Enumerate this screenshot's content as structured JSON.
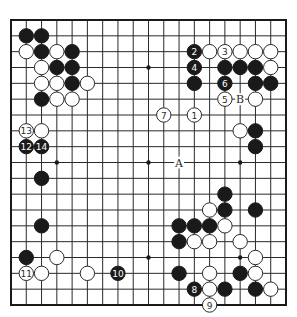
{
  "diagram": {
    "type": "go-board",
    "size": 19,
    "colors": {
      "black": "#1a1a1a",
      "white": "#ffffff",
      "line": "#2a2a2a",
      "background": "#ffffff"
    },
    "star_points": [
      [
        3,
        3
      ],
      [
        9,
        3
      ],
      [
        15,
        3
      ],
      [
        3,
        9
      ],
      [
        9,
        9
      ],
      [
        15,
        9
      ],
      [
        3,
        15
      ],
      [
        9,
        15
      ],
      [
        15,
        15
      ]
    ],
    "stones": [
      {
        "c": 1,
        "r": 1,
        "color": "black"
      },
      {
        "c": 2,
        "r": 1,
        "color": "black"
      },
      {
        "c": 1,
        "r": 2,
        "color": "white"
      },
      {
        "c": 2,
        "r": 2,
        "color": "black"
      },
      {
        "c": 3,
        "r": 2,
        "color": "white"
      },
      {
        "c": 4,
        "r": 2,
        "color": "black"
      },
      {
        "c": 2,
        "r": 3,
        "color": "white"
      },
      {
        "c": 3,
        "r": 3,
        "color": "black"
      },
      {
        "c": 4,
        "r": 3,
        "color": "black"
      },
      {
        "c": 2,
        "r": 4,
        "color": "white"
      },
      {
        "c": 3,
        "r": 4,
        "color": "white"
      },
      {
        "c": 4,
        "r": 4,
        "color": "black"
      },
      {
        "c": 5,
        "r": 4,
        "color": "white"
      },
      {
        "c": 2,
        "r": 5,
        "color": "black"
      },
      {
        "c": 3,
        "r": 5,
        "color": "white"
      },
      {
        "c": 4,
        "r": 5,
        "color": "white"
      },
      {
        "c": 1,
        "r": 7,
        "color": "white",
        "number": "13"
      },
      {
        "c": 2,
        "r": 7,
        "color": "white"
      },
      {
        "c": 1,
        "r": 8,
        "color": "black",
        "number": "12"
      },
      {
        "c": 2,
        "r": 8,
        "color": "black",
        "number": "14"
      },
      {
        "c": 2,
        "r": 10,
        "color": "black"
      },
      {
        "c": 2,
        "r": 13,
        "color": "black"
      },
      {
        "c": 1,
        "r": 15,
        "color": "black"
      },
      {
        "c": 3,
        "r": 15,
        "color": "white"
      },
      {
        "c": 1,
        "r": 16,
        "color": "white",
        "number": "11"
      },
      {
        "c": 2,
        "r": 16,
        "color": "white"
      },
      {
        "c": 5,
        "r": 16,
        "color": "white"
      },
      {
        "c": 7,
        "r": 16,
        "color": "black",
        "number": "10"
      },
      {
        "c": 12,
        "r": 2,
        "color": "black",
        "number": "2"
      },
      {
        "c": 13,
        "r": 2,
        "color": "white"
      },
      {
        "c": 14,
        "r": 2,
        "color": "white",
        "number": "3"
      },
      {
        "c": 15,
        "r": 2,
        "color": "white"
      },
      {
        "c": 16,
        "r": 2,
        "color": "white"
      },
      {
        "c": 17,
        "r": 2,
        "color": "white"
      },
      {
        "c": 12,
        "r": 3,
        "color": "black",
        "number": "4"
      },
      {
        "c": 14,
        "r": 3,
        "color": "black"
      },
      {
        "c": 15,
        "r": 3,
        "color": "black"
      },
      {
        "c": 16,
        "r": 3,
        "color": "black"
      },
      {
        "c": 17,
        "r": 3,
        "color": "white"
      },
      {
        "c": 12,
        "r": 4,
        "color": "black"
      },
      {
        "c": 14,
        "r": 4,
        "color": "black",
        "number": "6"
      },
      {
        "c": 16,
        "r": 4,
        "color": "black"
      },
      {
        "c": 17,
        "r": 4,
        "color": "black"
      },
      {
        "c": 14,
        "r": 5,
        "color": "white",
        "number": "5"
      },
      {
        "c": 16,
        "r": 5,
        "color": "white"
      },
      {
        "c": 10,
        "r": 6,
        "color": "white",
        "number": "7"
      },
      {
        "c": 12,
        "r": 6,
        "color": "white",
        "number": "1"
      },
      {
        "c": 15,
        "r": 7,
        "color": "white"
      },
      {
        "c": 16,
        "r": 7,
        "color": "black"
      },
      {
        "c": 16,
        "r": 8,
        "color": "black"
      },
      {
        "c": 14,
        "r": 11,
        "color": "black"
      },
      {
        "c": 13,
        "r": 12,
        "color": "white"
      },
      {
        "c": 14,
        "r": 12,
        "color": "black"
      },
      {
        "c": 16,
        "r": 12,
        "color": "black"
      },
      {
        "c": 11,
        "r": 13,
        "color": "black"
      },
      {
        "c": 12,
        "r": 13,
        "color": "black"
      },
      {
        "c": 13,
        "r": 13,
        "color": "black"
      },
      {
        "c": 14,
        "r": 13,
        "color": "white"
      },
      {
        "c": 11,
        "r": 14,
        "color": "black"
      },
      {
        "c": 12,
        "r": 14,
        "color": "white"
      },
      {
        "c": 13,
        "r": 14,
        "color": "white"
      },
      {
        "c": 15,
        "r": 14,
        "color": "white"
      },
      {
        "c": 16,
        "r": 15,
        "color": "white"
      },
      {
        "c": 11,
        "r": 16,
        "color": "black"
      },
      {
        "c": 13,
        "r": 16,
        "color": "white"
      },
      {
        "c": 15,
        "r": 16,
        "color": "black"
      },
      {
        "c": 16,
        "r": 16,
        "color": "white"
      },
      {
        "c": 12,
        "r": 17,
        "color": "black",
        "number": "8"
      },
      {
        "c": 13,
        "r": 17,
        "color": "white"
      },
      {
        "c": 14,
        "r": 17,
        "color": "black"
      },
      {
        "c": 16,
        "r": 17,
        "color": "black"
      },
      {
        "c": 17,
        "r": 17,
        "color": "white"
      },
      {
        "c": 13,
        "r": 18,
        "color": "white",
        "number": "9"
      }
    ],
    "labels": [
      {
        "c": 11,
        "r": 9,
        "text": "A"
      },
      {
        "c": 15,
        "r": 5,
        "text": "B"
      }
    ]
  }
}
